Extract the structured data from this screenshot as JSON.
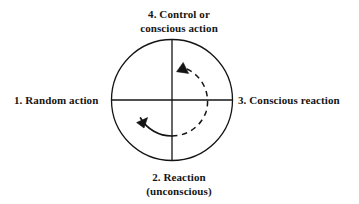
{
  "diagram": {
    "type": "cycle-quadrant-diagram",
    "labels": {
      "quadrant_top": {
        "line1": "4.  Control or",
        "line2": "conscious action"
      },
      "quadrant_left": {
        "line1": "1.  Random action"
      },
      "quadrant_right": {
        "line1": "3.  Conscious reaction"
      },
      "quadrant_bottom": {
        "line1": "2.  Reaction",
        "line2": "(unconscious)"
      }
    },
    "geometry": {
      "circle_center_x": 172,
      "circle_center_y": 100,
      "circle_radius": 61,
      "inner_arc_radius": 36
    },
    "colors": {
      "stroke": "#141414",
      "background": "#ffffff",
      "text": "#141414"
    }
  }
}
